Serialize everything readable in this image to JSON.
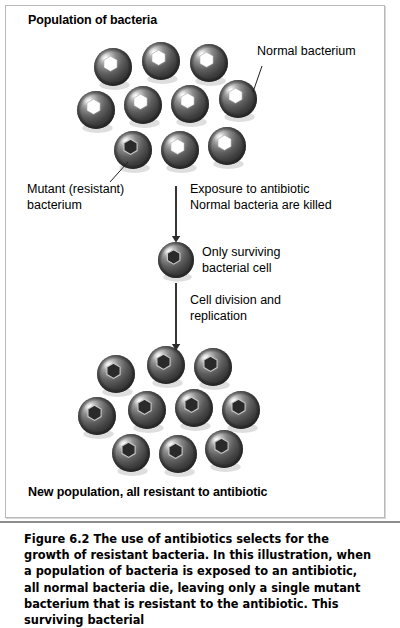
{
  "figure": {
    "top_label": "Population of bacteria",
    "bottom_label": "New population, all resistant to antibiotic",
    "callouts": {
      "normal": "Normal bacterium",
      "mutant_line1": "Mutant (resistant)",
      "mutant_line2": "bacterium",
      "surviving_line1": "Only surviving",
      "surviving_line2": "bacterial cell"
    },
    "steps": {
      "step1_line1": "Exposure to antibiotic",
      "step1_line2": "Normal bacteria are killed",
      "step2_line1": "Cell division and",
      "step2_line2": "replication"
    },
    "caption": {
      "number": "Figure 6.2",
      "text": "  The use of antibiotics selects for the growth of resistant bacteria. In this illustration, when a population of bacteria is exposed to an antibiotic, all normal bacteria die, leaving only a single mutant bacterium that is resistant to the antibiotic. This surviving bacterial"
    },
    "colors": {
      "cell_fill": "#4c4c4c",
      "cell_shadow": "#2b2b2b",
      "cell_highlight": "#e8e8e8",
      "normal_center": "#ffffff",
      "mutant_center": "#2a2a2a",
      "arrow": "#2b2b2b",
      "panel_border": "#b9b9b9",
      "caption_rule": "#8d8d8d"
    },
    "chart_data": {
      "type": "diagram",
      "title": "Antibiotic selection for resistant bacteria",
      "stages": [
        {
          "name": "Population of bacteria",
          "total_cells": 10,
          "normal_cells": 9,
          "mutant_cells": 1,
          "rows": [
            3,
            4,
            3
          ],
          "cells": [
            {
              "cx": 113,
              "cy": 67,
              "r": 19,
              "type": "normal"
            },
            {
              "cx": 161,
              "cy": 61,
              "r": 19,
              "type": "normal"
            },
            {
              "cx": 209,
              "cy": 63,
              "r": 19,
              "type": "normal"
            },
            {
              "cx": 96,
              "cy": 110,
              "r": 19,
              "type": "normal"
            },
            {
              "cx": 143,
              "cy": 105,
              "r": 19,
              "type": "normal"
            },
            {
              "cx": 190,
              "cy": 104,
              "r": 19,
              "type": "normal"
            },
            {
              "cx": 238,
              "cy": 99,
              "r": 19,
              "type": "normal"
            },
            {
              "cx": 133,
              "cy": 150,
              "r": 19,
              "type": "mutant"
            },
            {
              "cx": 180,
              "cy": 150,
              "r": 19,
              "type": "normal"
            },
            {
              "cx": 227,
              "cy": 146,
              "r": 19,
              "type": "normal"
            }
          ]
        },
        {
          "name": "Only surviving bacterial cell",
          "total_cells": 1,
          "normal_cells": 0,
          "mutant_cells": 1,
          "rows": [
            1
          ],
          "cells": [
            {
              "cx": 176,
              "cy": 260,
              "r": 18,
              "type": "mutant"
            }
          ]
        },
        {
          "name": "New population, all resistant to antibiotic",
          "total_cells": 10,
          "normal_cells": 0,
          "mutant_cells": 10,
          "rows": [
            3,
            4,
            3
          ],
          "cells": [
            {
              "cx": 116,
              "cy": 374,
              "r": 19,
              "type": "mutant"
            },
            {
              "cx": 166,
              "cy": 365,
              "r": 19,
              "type": "mutant"
            },
            {
              "cx": 213,
              "cy": 367,
              "r": 19,
              "type": "mutant"
            },
            {
              "cx": 97,
              "cy": 416,
              "r": 19,
              "type": "mutant"
            },
            {
              "cx": 147,
              "cy": 410,
              "r": 19,
              "type": "mutant"
            },
            {
              "cx": 194,
              "cy": 408,
              "r": 19,
              "type": "mutant"
            },
            {
              "cx": 241,
              "cy": 410,
              "r": 19,
              "type": "mutant"
            },
            {
              "cx": 131,
              "cy": 453,
              "r": 19,
              "type": "mutant"
            },
            {
              "cx": 178,
              "cy": 454,
              "r": 19,
              "type": "mutant"
            },
            {
              "cx": 224,
              "cy": 449,
              "r": 19,
              "type": "mutant"
            }
          ]
        }
      ],
      "arrows": [
        {
          "x": 176,
          "y1": 186,
          "y2": 239,
          "label": "Exposure to antibiotic / Normal bacteria are killed"
        },
        {
          "x": 176,
          "y1": 283,
          "y2": 347,
          "label": "Cell division and replication"
        }
      ],
      "leader_lines": [
        {
          "from": [
            262,
            66
          ],
          "to": [
            253,
            92
          ],
          "label": "Normal bacterium"
        },
        {
          "from": [
            128,
            162
          ],
          "to": [
            110,
            182
          ],
          "label": "Mutant (resistant) bacterium"
        }
      ]
    }
  }
}
